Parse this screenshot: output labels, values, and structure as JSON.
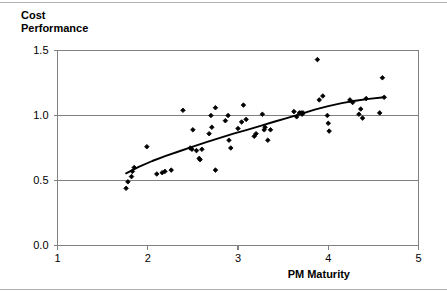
{
  "chart_data": {
    "type": "scatter",
    "title": "Cost\nPerformance",
    "xlabel": "PM Maturity",
    "ylabel": "Cost Performance",
    "xlim": [
      1,
      5
    ],
    "ylim": [
      0.0,
      1.5
    ],
    "xticks": [
      "1",
      "2",
      "3",
      "4",
      "5"
    ],
    "xtick_values": [
      1,
      2,
      3,
      4,
      5
    ],
    "yticks": [
      "0.0",
      "0.5",
      "1.0",
      "1.5"
    ],
    "ytick_values": [
      0.0,
      0.5,
      1.0,
      1.5
    ],
    "grid": "horizontal",
    "legend": "none",
    "marker": "diamond",
    "marker_color": "#000000",
    "trendline_color": "#000000",
    "points": [
      [
        1.76,
        0.44
      ],
      [
        1.78,
        0.49
      ],
      [
        1.82,
        0.53
      ],
      [
        1.83,
        0.57
      ],
      [
        1.85,
        0.6
      ],
      [
        1.99,
        0.76
      ],
      [
        2.1,
        0.55
      ],
      [
        2.16,
        0.56
      ],
      [
        2.19,
        0.57
      ],
      [
        2.26,
        0.58
      ],
      [
        2.39,
        1.04
      ],
      [
        2.47,
        0.75
      ],
      [
        2.49,
        0.74
      ],
      [
        2.5,
        0.89
      ],
      [
        2.54,
        0.73
      ],
      [
        2.57,
        0.67
      ],
      [
        2.58,
        0.66
      ],
      [
        2.6,
        0.74
      ],
      [
        2.68,
        0.86
      ],
      [
        2.7,
        1.0
      ],
      [
        2.71,
        0.91
      ],
      [
        2.75,
        1.06
      ],
      [
        2.75,
        0.58
      ],
      [
        2.86,
        0.96
      ],
      [
        2.89,
        1.0
      ],
      [
        2.9,
        0.81
      ],
      [
        2.92,
        0.75
      ],
      [
        3.0,
        0.9
      ],
      [
        3.04,
        0.95
      ],
      [
        3.06,
        1.08
      ],
      [
        3.09,
        0.97
      ],
      [
        3.18,
        0.84
      ],
      [
        3.2,
        0.86
      ],
      [
        3.27,
        1.01
      ],
      [
        3.29,
        0.89
      ],
      [
        3.3,
        0.91
      ],
      [
        3.33,
        0.81
      ],
      [
        3.36,
        0.89
      ],
      [
        3.62,
        1.03
      ],
      [
        3.65,
        0.99
      ],
      [
        3.68,
        1.02
      ],
      [
        3.7,
        1.02
      ],
      [
        3.71,
        1.01
      ],
      [
        3.72,
        1.02
      ],
      [
        3.88,
        1.43
      ],
      [
        3.9,
        1.12
      ],
      [
        3.94,
        1.15
      ],
      [
        3.99,
        1.0
      ],
      [
        4.0,
        0.94
      ],
      [
        4.01,
        0.88
      ],
      [
        4.24,
        1.12
      ],
      [
        4.27,
        1.1
      ],
      [
        4.34,
        1.01
      ],
      [
        4.36,
        1.05
      ],
      [
        4.38,
        0.98
      ],
      [
        4.42,
        1.13
      ],
      [
        4.57,
        1.02
      ],
      [
        4.6,
        1.29
      ],
      [
        4.62,
        1.14
      ]
    ],
    "trendline": [
      [
        1.76,
        0.555
      ],
      [
        1.9,
        0.605
      ],
      [
        2.05,
        0.65
      ],
      [
        2.2,
        0.69
      ],
      [
        2.35,
        0.725
      ],
      [
        2.5,
        0.76
      ],
      [
        2.65,
        0.795
      ],
      [
        2.8,
        0.828
      ],
      [
        2.95,
        0.86
      ],
      [
        3.1,
        0.89
      ],
      [
        3.25,
        0.92
      ],
      [
        3.4,
        0.952
      ],
      [
        3.55,
        0.982
      ],
      [
        3.7,
        1.013
      ],
      [
        3.85,
        1.045
      ],
      [
        4.0,
        1.072
      ],
      [
        4.15,
        1.095
      ],
      [
        4.3,
        1.113
      ],
      [
        4.45,
        1.128
      ],
      [
        4.62,
        1.14
      ]
    ]
  },
  "axis_line_color": "#808080",
  "grid_line_color": "#808080",
  "plot_border_color": "#808080"
}
